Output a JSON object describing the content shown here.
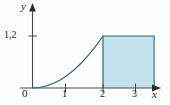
{
  "figure": {
    "background_color": "#fdfdfd",
    "axis_color": "#4a4a4a",
    "curve_color": "#2b6b72",
    "fill_color": "#c3e3ef",
    "rect_border_color": "#2b6b72",
    "text_color": "#1c1c1c"
  },
  "axes": {
    "y_axis_label": "y",
    "x_axis_label": "x",
    "origin_label": "0"
  },
  "chart_data": {
    "type": "line",
    "title": "",
    "subtitle": "",
    "xlabel": "x",
    "ylabel": "y",
    "xlim": [
      0,
      3.6
    ],
    "ylim": [
      0,
      1.6
    ],
    "grid": false,
    "legend": null,
    "x_ticks": [
      1,
      2,
      3
    ],
    "x_tick_labels": [
      "1",
      "2",
      "3"
    ],
    "y_ticks": [
      1.2
    ],
    "y_tick_labels": [
      "1,2"
    ],
    "series": [
      {
        "name": "curve",
        "kind": "line",
        "color": "#2b6b72",
        "x": [
          0,
          0.2,
          0.4,
          0.6,
          0.8,
          1.0,
          1.2,
          1.4,
          1.6,
          1.8,
          2.0
        ],
        "y": [
          0.0,
          0.012,
          0.048,
          0.108,
          0.192,
          0.3,
          0.432,
          0.588,
          0.768,
          0.972,
          1.2
        ]
      }
    ],
    "annotations": [
      {
        "kind": "shaded_rectangle",
        "name": "shaded-region",
        "x_from": 2,
        "x_to": 3.45,
        "y_from": 0,
        "y_to": 1.2,
        "fill": "#c3e3ef",
        "border": "#2b6b72"
      }
    ]
  },
  "tick_labels": {
    "y_1_2": "1,2",
    "x_1": "1",
    "x_2": "2",
    "x_3": "3"
  }
}
